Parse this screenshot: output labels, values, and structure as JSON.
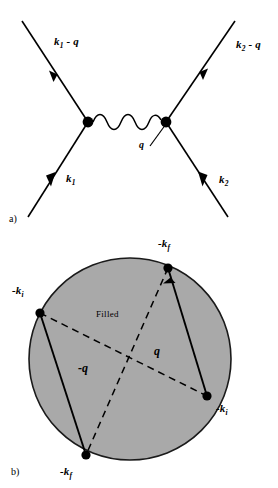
{
  "figure": {
    "background_color": "#ffffff",
    "ink_color": "#000000",
    "fill_color": "#a9a9a9",
    "panels": [
      {
        "id": "a",
        "panel_label": "a)",
        "type": "feynman-diagram",
        "description": "Two-vertex electron-electron scattering diagram with wavy photon exchange line",
        "vertices": [
          {
            "name": "left-vertex",
            "x": 88,
            "y": 122
          },
          {
            "name": "right-vertex",
            "x": 166,
            "y": 122
          }
        ],
        "photon": {
          "label": "q",
          "wiggles": 4
        },
        "legs": [
          {
            "name": "outgoing-left",
            "label_k": "k",
            "label_sub": "1",
            "label_suffix": " - q",
            "direction": "up-left",
            "arrow": "outgoing"
          },
          {
            "name": "outgoing-right",
            "label_k": "k",
            "label_sub": "2",
            "label_suffix": " - q",
            "direction": "up-right",
            "arrow": "outgoing"
          },
          {
            "name": "incoming-left",
            "label_k": "k",
            "label_sub": "1",
            "label_suffix": "",
            "direction": "down-left",
            "arrow": "incoming"
          },
          {
            "name": "incoming-right",
            "label_k": "k",
            "label_sub": "2",
            "label_suffix": "",
            "direction": "down-right",
            "arrow": "incoming"
          }
        ],
        "labels": {
          "top_left": {
            "base": "k",
            "sub": "1",
            "suffix": " - q"
          },
          "top_right": {
            "base": "k",
            "sub": "2",
            "suffix": " - q"
          },
          "bottom_left": {
            "base": "k",
            "sub": "1",
            "suffix": ""
          },
          "bottom_right": {
            "base": "k",
            "sub": "2",
            "suffix": ""
          },
          "photon": "q"
        }
      },
      {
        "id": "b",
        "panel_label": "b)",
        "type": "fermi-sphere",
        "description": "Filled Fermi sphere with two scattering pairs connected by momentum transfer vectors",
        "region_label": "Filled",
        "circle": {
          "cx": 130,
          "cy": 359,
          "r": 101
        },
        "points": [
          {
            "name": "point-top",
            "label_base": "-k",
            "label_sub": "f",
            "x": 168,
            "y": 268
          },
          {
            "name": "point-left",
            "label_base": "-k",
            "label_sub": "i",
            "x": 40,
            "y": 313
          },
          {
            "name": "point-right",
            "label_base": "-k",
            "label_sub": "i",
            "x": 207,
            "y": 396
          },
          {
            "name": "point-bottom",
            "label_base": "-k",
            "label_sub": "f",
            "x": 86,
            "y": 455
          }
        ],
        "solid_vectors": [
          {
            "name": "vector-left-pair",
            "from": "point-bottom",
            "to": "point-left",
            "arrow_at": "to"
          },
          {
            "name": "vector-right-pair",
            "from": "point-right",
            "to": "point-top",
            "arrow_at": "to"
          }
        ],
        "dashed_vectors": [
          {
            "name": "dashed-q",
            "from": "point-left",
            "to": "point-right",
            "label": "q"
          },
          {
            "name": "dashed-minus-q",
            "from": "point-top",
            "to": "point-bottom",
            "label": "-q"
          }
        ],
        "labels": {
          "top": {
            "base": "-k",
            "sub": "f"
          },
          "left": {
            "base": "-k",
            "sub": "i"
          },
          "right": {
            "base": "-k",
            "sub": "i"
          },
          "bottom": {
            "base": "-k",
            "sub": "f"
          },
          "q": "q",
          "minus_q": "-q",
          "filled": "Filled"
        }
      }
    ]
  }
}
